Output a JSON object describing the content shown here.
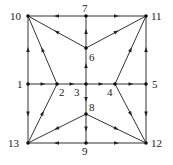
{
  "diagram": {
    "type": "directed-graph",
    "nodes": [
      {
        "id": "1",
        "label": "1",
        "x": 28,
        "y": 84,
        "lx": 17,
        "ly": 88
      },
      {
        "id": "2",
        "label": "2",
        "x": 57,
        "y": 84,
        "lx": 59,
        "ly": 96
      },
      {
        "id": "3",
        "label": "3",
        "x": 86,
        "y": 84,
        "lx": 74,
        "ly": 96
      },
      {
        "id": "4",
        "label": "4",
        "x": 115,
        "y": 84,
        "lx": 107,
        "ly": 96
      },
      {
        "id": "5",
        "label": "5",
        "x": 146,
        "y": 84,
        "lx": 152,
        "ly": 88
      },
      {
        "id": "6",
        "label": "6",
        "x": 86,
        "y": 48,
        "lx": 89,
        "ly": 61
      },
      {
        "id": "7",
        "label": "7",
        "x": 86,
        "y": 16,
        "lx": 82,
        "ly": 12
      },
      {
        "id": "8",
        "label": "8",
        "x": 86,
        "y": 114,
        "lx": 89,
        "ly": 111
      },
      {
        "id": "9",
        "label": "9",
        "x": 86,
        "y": 143,
        "lx": 82,
        "ly": 155
      },
      {
        "id": "10",
        "label": "10",
        "x": 28,
        "y": 16,
        "lx": 10,
        "ly": 20
      },
      {
        "id": "11",
        "label": "11",
        "x": 146,
        "y": 16,
        "lx": 151,
        "ly": 20
      },
      {
        "id": "12",
        "label": "12",
        "x": 146,
        "y": 143,
        "lx": 151,
        "ly": 147
      },
      {
        "id": "13",
        "label": "13",
        "x": 28,
        "y": 143,
        "lx": 8,
        "ly": 147
      }
    ],
    "edges": [
      {
        "from": "7",
        "to": "10"
      },
      {
        "from": "7",
        "to": "11"
      },
      {
        "from": "1",
        "to": "2"
      },
      {
        "from": "2",
        "to": "3"
      },
      {
        "from": "3",
        "to": "4"
      },
      {
        "from": "4",
        "to": "5"
      },
      {
        "from": "9",
        "to": "13"
      },
      {
        "from": "9",
        "to": "12"
      },
      {
        "from": "1",
        "to": "10"
      },
      {
        "from": "1",
        "to": "13"
      },
      {
        "from": "5",
        "to": "11"
      },
      {
        "from": "5",
        "to": "12"
      },
      {
        "from": "6",
        "to": "7"
      },
      {
        "from": "3",
        "to": "6"
      },
      {
        "from": "3",
        "to": "8"
      },
      {
        "from": "8",
        "to": "9"
      },
      {
        "from": "6",
        "to": "10"
      },
      {
        "from": "2",
        "to": "10"
      },
      {
        "from": "6",
        "to": "11"
      },
      {
        "from": "4",
        "to": "11"
      },
      {
        "from": "13",
        "to": "2"
      },
      {
        "from": "8",
        "to": "13"
      },
      {
        "from": "8",
        "to": "12"
      },
      {
        "from": "4",
        "to": "12"
      }
    ]
  }
}
